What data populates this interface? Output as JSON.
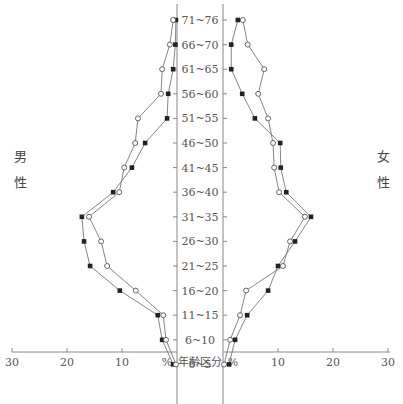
{
  "chart_data": {
    "type": "line",
    "title": "",
    "xlabel": "%",
    "center_label": "年齢区分",
    "categories": [
      "71~76",
      "66~70",
      "61~65",
      "56~60",
      "51~55",
      "46~50",
      "41~45",
      "36~40",
      "31~35",
      "26~30",
      "21~25",
      "16~20",
      "11~15",
      "6~10",
      "0~5"
    ],
    "left_panel": {
      "label": [
        "男",
        "性"
      ],
      "tick_labels": [
        "30",
        "20",
        "10",
        "%"
      ],
      "xlim": [
        30,
        0
      ],
      "series": [
        {
          "name": "filled-square",
          "marker": "filled",
          "values": [
            0.2,
            0.3,
            0.7,
            1.6,
            1.8,
            5.8,
            8.2,
            11.6,
            17.3,
            16.9,
            15.8,
            10.4,
            3.5,
            2.7,
            0.7
          ]
        },
        {
          "name": "open-circle",
          "marker": "open",
          "values": [
            0.7,
            1.3,
            2.7,
            2.9,
            7.1,
            7.6,
            9.6,
            10.5,
            16.0,
            13.8,
            12.7,
            7.5,
            2.5,
            2.0,
            0.2
          ]
        }
      ]
    },
    "right_panel": {
      "label": [
        "女",
        "性"
      ],
      "tick_labels": [
        "%",
        "10",
        "20",
        "30"
      ],
      "xlim": [
        0,
        30
      ],
      "series": [
        {
          "name": "filled-square",
          "marker": "filled",
          "values": [
            2.7,
            1.5,
            1.5,
            3.5,
            5.8,
            10.4,
            10.5,
            11.5,
            16.0,
            13.1,
            10.0,
            8.2,
            4.4,
            2.2,
            1.1
          ]
        },
        {
          "name": "open-circle",
          "marker": "open",
          "values": [
            3.6,
            4.5,
            7.5,
            6.4,
            8.2,
            9.1,
            9.3,
            10.2,
            14.9,
            12.2,
            10.9,
            4.2,
            3.1,
            1.3,
            0.2
          ]
        }
      ]
    },
    "grid": false,
    "legend": "none"
  },
  "labels": {
    "male": [
      "男",
      "性"
    ],
    "female": [
      "女",
      "性"
    ],
    "center_axis": "年齢区分",
    "percent": "%"
  },
  "colors": {
    "line": "#777777",
    "filled_marker": "#222222",
    "open_marker": "#ffffff",
    "axis": "#888888"
  }
}
